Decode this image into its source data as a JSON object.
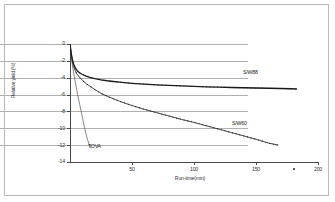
{
  "figure": {
    "frame_color": "#b9b9b9",
    "background": "#ffffff",
    "grid_color": "#b0b0b0",
    "axis_color": "#4a4a4a"
  },
  "chart_data": {
    "type": "line",
    "title": "",
    "xlabel": "Run-time(min)",
    "ylabel": "Relative yield (%)",
    "xlim": [
      0,
      200
    ],
    "ylim": [
      -14,
      0
    ],
    "xticks": [
      50,
      100,
      150,
      200
    ],
    "xtick_labels": [
      "50",
      "100",
      "150",
      "200"
    ],
    "yticks": [
      0,
      -2,
      -4,
      -6,
      -8,
      -10,
      -12,
      -14
    ],
    "ytick_labels": [
      "0",
      "-2",
      "-4",
      "-6",
      "-8",
      "-10",
      "-12",
      "-14"
    ],
    "grid": "horizontal",
    "legend_position": "inline-annotations",
    "series": [
      {
        "name": "S/W88",
        "label": "S/W88",
        "color": "#1a1a1a",
        "marker": "dot",
        "x": [
          0,
          1,
          2,
          3,
          4,
          5,
          6,
          8,
          10,
          13,
          16,
          20,
          25,
          30,
          35,
          40,
          50,
          60,
          70,
          80,
          90,
          100,
          110,
          120,
          130,
          140,
          150,
          160,
          170,
          178,
          183
        ],
        "y": [
          0,
          -1.1,
          -1.9,
          -2.4,
          -2.75,
          -3.0,
          -3.2,
          -3.45,
          -3.62,
          -3.8,
          -3.95,
          -4.1,
          -4.25,
          -4.36,
          -4.45,
          -4.53,
          -4.66,
          -4.76,
          -4.85,
          -4.92,
          -4.98,
          -5.03,
          -5.08,
          -5.12,
          -5.16,
          -5.19,
          -5.22,
          -5.25,
          -5.28,
          -5.31,
          -5.34
        ]
      },
      {
        "name": "S/W60",
        "label": "S/W60",
        "color": "#1a1a1a",
        "marker": "dot",
        "x": [
          0,
          1,
          2,
          3,
          4,
          5,
          6,
          8,
          10,
          13,
          16,
          20,
          25,
          30,
          35,
          40,
          50,
          60,
          70,
          80,
          90,
          100,
          110,
          120,
          130,
          140,
          150,
          160,
          168
        ],
        "y": [
          0,
          -1.2,
          -2.1,
          -2.7,
          -3.1,
          -3.4,
          -3.65,
          -4.0,
          -4.3,
          -4.7,
          -5.0,
          -5.4,
          -5.85,
          -6.2,
          -6.5,
          -6.8,
          -7.3,
          -7.75,
          -8.15,
          -8.55,
          -8.95,
          -9.3,
          -9.7,
          -10.1,
          -10.5,
          -10.9,
          -11.3,
          -11.75,
          -12.0
        ]
      },
      {
        "name": "TOVA",
        "label": "TOVA",
        "color": "#555555",
        "marker": "none",
        "x": [
          0,
          1,
          2,
          3,
          4,
          5,
          6,
          8,
          10,
          12,
          14,
          16,
          17
        ],
        "y": [
          0,
          -1.4,
          -2.6,
          -3.5,
          -4.3,
          -5.1,
          -5.9,
          -7.3,
          -8.7,
          -10.1,
          -11.3,
          -12.1,
          -12.35
        ]
      }
    ]
  }
}
